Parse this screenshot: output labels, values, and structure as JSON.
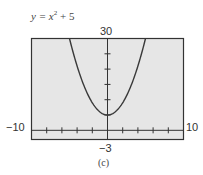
{
  "figure": {
    "equation_prefix": "y = x",
    "equation_exp": "2",
    "equation_suffix": " + 5",
    "caption": "(c)"
  },
  "window": {
    "xmin_label": "−10",
    "xmax_label": "10",
    "ymin_label": "−3",
    "ymax_label": "30"
  },
  "chart_data": {
    "type": "line",
    "xlabel": "",
    "ylabel": "",
    "xlim": [
      -10,
      10
    ],
    "ylim": [
      -3,
      30
    ],
    "x_tick_step": 2,
    "y_tick_step": 5,
    "grid": false,
    "legend": null,
    "annotations": [
      "(c)"
    ],
    "series": [
      {
        "name": "y = x^2 + 5",
        "x": [
          -5,
          -4,
          -3,
          -2,
          -1,
          0,
          1,
          2,
          3,
          4,
          5
        ],
        "y": [
          30,
          21,
          14,
          9,
          6,
          5,
          6,
          9,
          14,
          21,
          30
        ]
      }
    ],
    "colors": {
      "background": "#e6e6e6",
      "frame": "#333333",
      "curve": "#3a3a3a"
    }
  }
}
